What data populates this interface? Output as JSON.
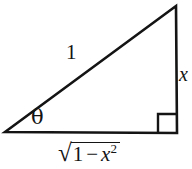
{
  "figure": {
    "background_color": "#ffffff",
    "stroke_color": "#141414",
    "stroke_width": 2.6,
    "vertices": {
      "left": [
        5,
        132
      ],
      "apex": [
        176,
        6
      ],
      "right": [
        177,
        133
      ]
    },
    "right_angle_marker": {
      "x": 158,
      "y": 114,
      "size": 18
    }
  },
  "labels": {
    "hypotenuse": "1",
    "opposite": "x",
    "angle": "θ",
    "adjacent": {
      "radical": "√",
      "one": "1",
      "operator": "−",
      "variable": "x",
      "exponent": "2",
      "full": "√(1 − x²)"
    }
  }
}
